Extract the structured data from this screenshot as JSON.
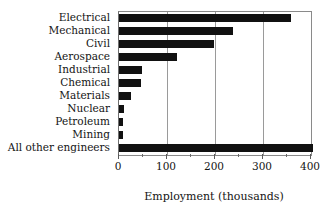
{
  "chart_data": {
    "type": "bar",
    "orientation": "horizontal",
    "title": "",
    "xlabel": "Employment (thousands)",
    "ylabel": "",
    "categories": [
      "Electrical",
      "Mechanical",
      "Civil",
      "Aerospace",
      "Industrial",
      "Chemical",
      "Materials",
      "Nuclear",
      "Petroleum",
      "Mining",
      "All other engineers"
    ],
    "values": [
      358,
      237,
      198,
      121,
      48,
      46,
      25,
      10,
      9,
      8,
      405
    ],
    "xlim": [
      0,
      400
    ],
    "xticks": [
      0,
      100,
      200,
      300,
      400
    ],
    "xtick_labels": [
      "0",
      "100",
      "200",
      "300",
      "400"
    ],
    "xminor_ticks": [
      50,
      150,
      250,
      350
    ],
    "grid": true,
    "grid_axis": "x",
    "legend": false,
    "bar_color": "#111111",
    "axis_color": "#8a8a8a",
    "background": "#ffffff"
  }
}
